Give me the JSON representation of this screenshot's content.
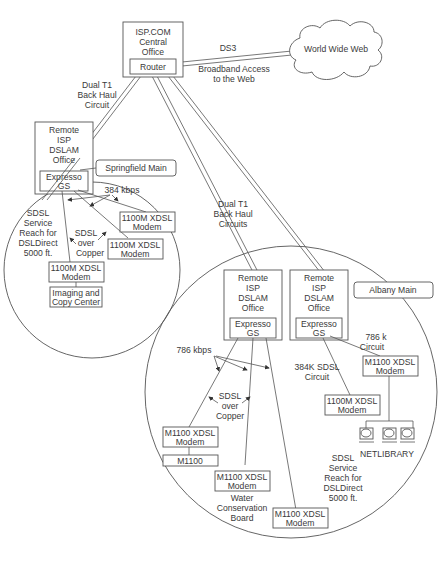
{
  "central_office": {
    "title_lines": [
      "ISP.COM",
      "Central",
      "Office"
    ],
    "router": "Router"
  },
  "internet": {
    "cloud_label": "World Wide Web",
    "link_label": "DS3",
    "link_caption_lines": [
      "Broadband Access",
      "to the Web"
    ]
  },
  "springfield": {
    "backhaul_label_lines": [
      "Dual T1",
      "Back Haul",
      "Circuit"
    ],
    "office_lines": [
      "Remote",
      "ISP",
      "DSLAM",
      "Office"
    ],
    "dslam": [
      "Expresso",
      "GS"
    ],
    "site_label": "Springfield Main",
    "speed_label": "384 kbps",
    "reach_lines": [
      "SDSL",
      "Service",
      "Reach for",
      "DSLDirect",
      "5000 ft."
    ],
    "medium_lines": [
      "SDSL",
      "over",
      "Copper"
    ],
    "modems": [
      [
        "1100M XDSL",
        "Modem"
      ],
      [
        "1100M XDSL",
        "Modem"
      ],
      [
        "1100M XDSL",
        "Modem"
      ]
    ],
    "endpoint_lines": [
      "Imaging and",
      "Copy Center"
    ]
  },
  "albany": {
    "backhaul_label_lines": [
      "Dual T1",
      "Back Haul",
      "Circuits"
    ],
    "site_label": "Albany Main",
    "office1_lines": [
      "Remote",
      "ISP",
      "DSLAM",
      "Office"
    ],
    "office1_dslam": [
      "Expresso",
      "GS"
    ],
    "office2_lines": [
      "Remote",
      "ISP",
      "DSLAM",
      "Office"
    ],
    "office2_dslam": [
      "Expresso",
      "GS"
    ],
    "speed_label": "786 kbps",
    "medium_lines": [
      "SDSL",
      "over",
      "Copper"
    ],
    "circuit_786_lines": [
      "786 k",
      "Circuit"
    ],
    "circuit_384_lines": [
      "384K SDSL",
      "Circuit"
    ],
    "modems": {
      "m1": [
        "M1100 XDSL",
        "Modem"
      ],
      "m1_device": "M1100",
      "m2": [
        "M1100 XDSL",
        "Modem"
      ],
      "m2_caption": [
        "Water",
        "Conservation",
        "Board"
      ],
      "m3": [
        "M1100 XDSL",
        "Modem"
      ],
      "m4": [
        "1100M XDSL",
        "Modem"
      ],
      "m5": [
        "M1100 XDSL",
        "Modem"
      ]
    },
    "library_label": "NETLIBRARY",
    "reach_lines": [
      "SDSL",
      "Service",
      "Reach for",
      "DSLDirect",
      "5000 ft."
    ]
  }
}
